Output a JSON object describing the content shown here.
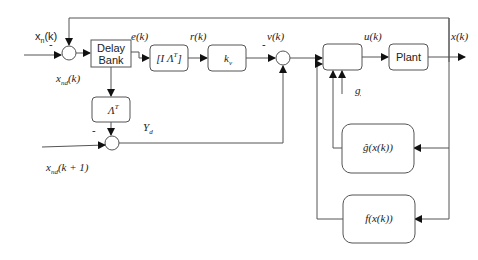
{
  "diagram": {
    "type": "block-diagram",
    "blocks": {
      "delay_bank": {
        "line1": "Delay",
        "line2": "Bank"
      },
      "i_lambda": {
        "label": "[I  Λ",
        "sup": "T",
        "close": "]"
      },
      "kv": {
        "label": "k",
        "sub": "v"
      },
      "lambda_t": {
        "label": "Λ",
        "sup": "T"
      },
      "controller": {
        "label": ""
      },
      "plant": {
        "label": "Plant"
      },
      "g_hat": {
        "label": "ĝ(x(k))"
      },
      "f": {
        "label": "f(x(k))"
      }
    },
    "signals": {
      "xn": {
        "base": "x",
        "sub": "n",
        "rest": "(k)"
      },
      "xn_minus": "-",
      "xnd": {
        "base": "x",
        "sub": "nd",
        "rest": "(k)"
      },
      "e": "e(k)",
      "r": "r(k)",
      "v": "v(k)",
      "v_minus": "-",
      "u": "u(k)",
      "x": "x(k)",
      "g": "g",
      "yd": {
        "base": "Y",
        "sub": "d"
      },
      "sum3_minus": "-",
      "xnd_next": {
        "base": "x",
        "sub": "nd",
        "rest": "(k + 1)"
      }
    }
  }
}
